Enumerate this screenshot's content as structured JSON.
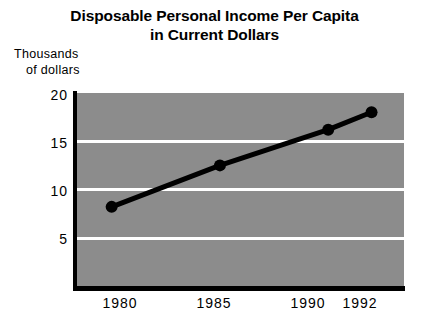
{
  "chart_data": {
    "type": "line",
    "title": "Disposable Personal Income Per Capita in Current Dollars",
    "title_lines": [
      "Disposable Personal Income Per Capita",
      "in Current Dollars"
    ],
    "ylabel_lines": [
      "Thousands",
      "of  dollars"
    ],
    "ylabel": "Thousands of dollars",
    "xlabel": "",
    "x": [
      1980,
      1985,
      1990,
      1992
    ],
    "categories": [
      "1980",
      "1985",
      "1990",
      "1992"
    ],
    "values": [
      8.2,
      12.5,
      16.2,
      18.0
    ],
    "series": [
      {
        "name": "Disposable personal income per capita",
        "values": [
          8.2,
          12.5,
          16.2,
          18.0
        ]
      }
    ],
    "ylim": [
      0,
      20
    ],
    "xlim": [
      1978.4,
      1993.5
    ],
    "yticks": [
      5,
      10,
      15,
      20
    ],
    "ytick_labels": [
      "5",
      "10",
      "15",
      "20"
    ],
    "xticks": [
      1980,
      1985,
      1990,
      1992
    ],
    "xtick_labels": [
      "1980",
      "1985",
      "1990",
      "1992"
    ],
    "gridlines": {
      "visible": true,
      "axis": "y",
      "values": [
        5,
        10,
        15
      ],
      "color": "#ffffff"
    },
    "legend": {
      "visible": false,
      "position": "none"
    },
    "colors": {
      "plot_background": "#8c8c8c",
      "page_background": "#ffffff",
      "line": "#000000",
      "marker": "#000000",
      "gridline": "#ffffff",
      "axis": "#000000",
      "text": "#000000"
    },
    "marker": "circle",
    "line_width_px": 5,
    "marker_radius_px": 6
  }
}
